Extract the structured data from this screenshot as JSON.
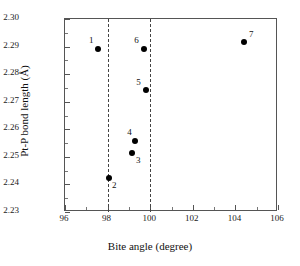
{
  "chart_data": {
    "type": "scatter",
    "title": "",
    "xlabel": "Bite angle (degree)",
    "ylabel": "Pt-P bond length (Å)",
    "xlim": [
      96,
      106
    ],
    "ylim": [
      2.23,
      2.3
    ],
    "xticks": [
      96,
      98,
      100,
      102,
      104,
      106
    ],
    "xtick_labels": [
      "96",
      "98",
      "100",
      "102",
      "104",
      "106"
    ],
    "xminor_ticks": [
      97,
      99,
      101,
      103,
      105
    ],
    "yticks": [
      2.23,
      2.24,
      2.25,
      2.26,
      2.27,
      2.28,
      2.29,
      2.3
    ],
    "ytick_labels": [
      "2.23",
      "2.24",
      "2.25",
      "2.26",
      "2.27",
      "2.28",
      "2.29",
      "2.30"
    ],
    "yminor_ticks": [
      2.235,
      2.245,
      2.255,
      2.265,
      2.275,
      2.285,
      2.295
    ],
    "grid": false,
    "legend": "none",
    "reference_lines": [
      {
        "axis": "x",
        "value": 98,
        "style": "dashed",
        "color": "#444444"
      },
      {
        "axis": "x",
        "value": 100,
        "style": "dashed",
        "color": "#444444"
      }
    ],
    "marker": {
      "shape": "circle",
      "color": "#000000",
      "size": 6
    },
    "points": [
      {
        "label": "1",
        "x": 97.55,
        "y": 2.2893,
        "label_dx": -9,
        "label_dy": -13
      },
      {
        "label": "2",
        "x": 98.07,
        "y": 2.2422,
        "label_dx": 3,
        "label_dy": 3
      },
      {
        "label": "3",
        "x": 99.15,
        "y": 2.2515,
        "label_dx": 4,
        "label_dy": 3
      },
      {
        "label": "4",
        "x": 99.3,
        "y": 2.2558,
        "label_dx": -8,
        "label_dy": -13
      },
      {
        "label": "5",
        "x": 99.82,
        "y": 2.2744,
        "label_dx": -10,
        "label_dy": -12
      },
      {
        "label": "6",
        "x": 99.72,
        "y": 2.2891,
        "label_dx": -10,
        "label_dy": -13
      },
      {
        "label": "7",
        "x": 104.4,
        "y": 2.2915,
        "label_dx": 5,
        "label_dy": -12
      }
    ]
  }
}
